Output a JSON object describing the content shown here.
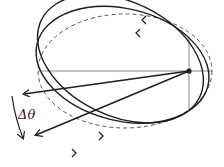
{
  "diagram": {
    "angle_label": "Δθ",
    "colors": {
      "stroke": "#1e1e1e",
      "axis": "#6a6a6a",
      "dashed": "#555555",
      "background": "#ffffff"
    },
    "elements": {
      "reference_orbit": "dashed ellipse",
      "orbits": [
        "solid ellipse 1",
        "solid ellipse 2"
      ],
      "focus": "focus point",
      "radial_lines": 2
    }
  }
}
